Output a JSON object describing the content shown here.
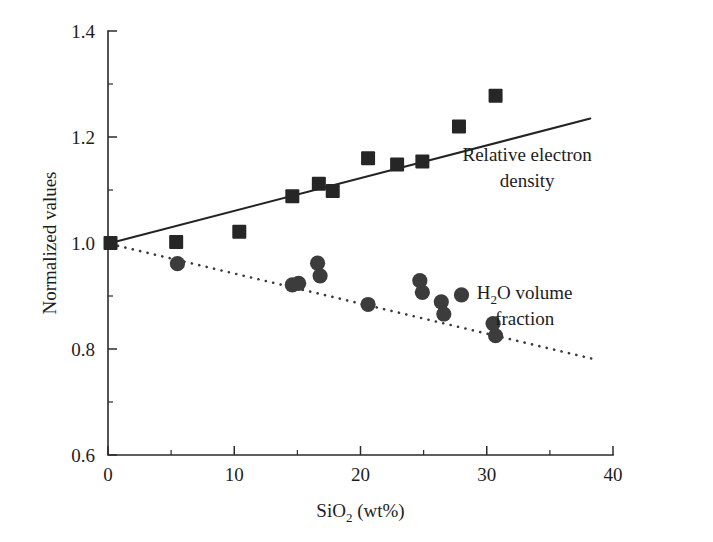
{
  "chart_data": {
    "type": "scatter",
    "title": "",
    "xlabel": "SiO2 (wt%)",
    "xlabel_parts": {
      "pre": "SiO",
      "sub": "2",
      "post": " (wt%)"
    },
    "ylabel": "Normalized values",
    "xlim": [
      0,
      40
    ],
    "ylim": [
      0.6,
      1.4
    ],
    "grid": false,
    "legend_position": "inline-annotations",
    "x_ticks_major": [
      0,
      10,
      20,
      30,
      40
    ],
    "x_tick_labels": [
      "0",
      "10",
      "20",
      "30",
      "40"
    ],
    "x_ticks_minor": [
      5,
      15,
      25,
      35
    ],
    "y_ticks_major": [
      0.6,
      0.8,
      1.0,
      1.2,
      1.4
    ],
    "y_tick_labels": [
      "0.6",
      "0.8",
      "1.0",
      "1.2",
      "1.4"
    ],
    "y_ticks_minor": [
      0.7,
      0.9,
      1.1,
      1.3
    ],
    "series": [
      {
        "name": "Relative electron density",
        "marker": "square",
        "color": "#262626",
        "points": [
          {
            "x": 0.2,
            "y": 1.0
          },
          {
            "x": 5.4,
            "y": 1.002
          },
          {
            "x": 10.4,
            "y": 1.021
          },
          {
            "x": 14.6,
            "y": 1.088
          },
          {
            "x": 16.7,
            "y": 1.112
          },
          {
            "x": 17.8,
            "y": 1.098
          },
          {
            "x": 20.6,
            "y": 1.16
          },
          {
            "x": 22.9,
            "y": 1.148
          },
          {
            "x": 24.9,
            "y": 1.154
          },
          {
            "x": 27.8,
            "y": 1.22
          },
          {
            "x": 30.7,
            "y": 1.278
          }
        ],
        "trend": {
          "style": "solid",
          "x_start": 0.2,
          "y_start": 1.0,
          "x_end": 38.2,
          "y_end": 1.235
        },
        "annotation": {
          "lines": [
            "Relative electron",
            "density"
          ],
          "x": 33.2,
          "y": 1.155
        }
      },
      {
        "name": "H2O volume fraction",
        "marker": "circle",
        "color": "#3c3c3c",
        "points": [
          {
            "x": 5.5,
            "y": 0.961
          },
          {
            "x": 14.6,
            "y": 0.921
          },
          {
            "x": 15.1,
            "y": 0.924
          },
          {
            "x": 16.6,
            "y": 0.962
          },
          {
            "x": 16.8,
            "y": 0.938
          },
          {
            "x": 20.6,
            "y": 0.884
          },
          {
            "x": 24.7,
            "y": 0.929
          },
          {
            "x": 24.9,
            "y": 0.907
          },
          {
            "x": 26.4,
            "y": 0.889
          },
          {
            "x": 26.6,
            "y": 0.866
          },
          {
            "x": 28.0,
            "y": 0.902
          },
          {
            "x": 30.5,
            "y": 0.848
          },
          {
            "x": 30.7,
            "y": 0.825
          }
        ],
        "trend": {
          "style": "dotted",
          "x_start": 0.2,
          "y_start": 0.998,
          "x_end": 38.3,
          "y_end": 0.782
        },
        "annotation": {
          "lines": [
            "H2O volume",
            "fraction"
          ],
          "lines_rich": [
            {
              "pre": "H",
              "sub": "2",
              "post": "O volume"
            },
            {
              "pre": "fraction",
              "sub": "",
              "post": ""
            }
          ],
          "x": 33.0,
          "y": 0.895
        }
      }
    ]
  },
  "plot_geometry": {
    "left": 108,
    "right": 613,
    "top": 31,
    "bottom": 455
  },
  "colors": {
    "axis": "#2b2b2b",
    "square_marker": "#262626",
    "circle_marker": "#3c3c3c",
    "solid_trend": "#232323",
    "dotted_trend": "#3a3a3a",
    "background": "#ffffff",
    "text": "#1d1d1d"
  }
}
